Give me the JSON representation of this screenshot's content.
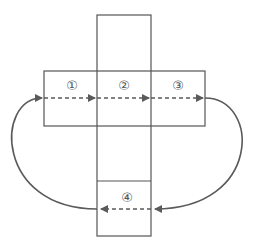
{
  "diagram": {
    "type": "cube-net-rotation",
    "colors": {
      "line": "#555555",
      "arrow": "#5a5a5a",
      "background": "#ffffff"
    },
    "faces": [
      {
        "id": "1",
        "label": "①"
      },
      {
        "id": "2",
        "label": "②"
      },
      {
        "id": "3",
        "label": "③"
      },
      {
        "id": "4",
        "label": "④"
      }
    ],
    "arrows": [
      {
        "from": "1",
        "to": "2",
        "style": "dashed"
      },
      {
        "from": "2",
        "to": "3",
        "style": "dashed"
      },
      {
        "from": "3",
        "to": "4",
        "style": "curved-solid"
      },
      {
        "from": "4",
        "to": "4-left",
        "style": "dashed"
      },
      {
        "from": "4",
        "to": "1",
        "style": "curved-solid"
      }
    ]
  }
}
